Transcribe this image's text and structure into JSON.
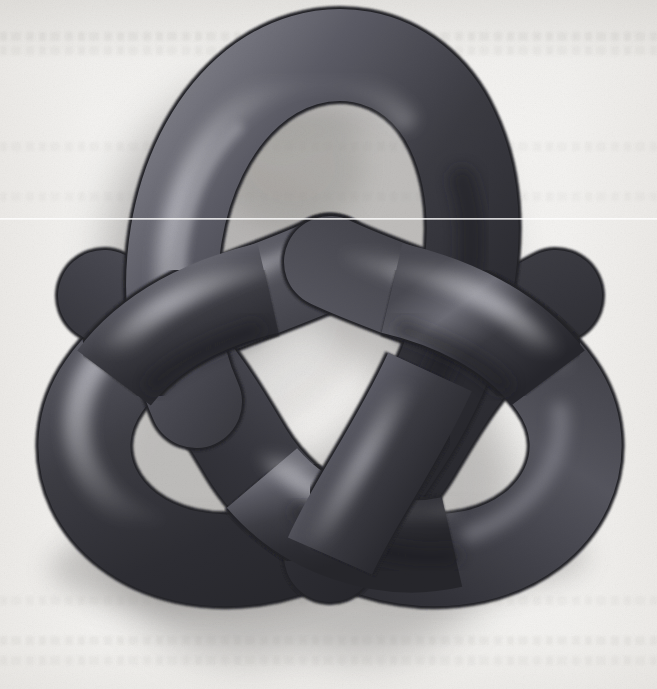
{
  "figure": {
    "kind": "3d-rendered-mathematical-object",
    "subject_name": "trefoil-knot",
    "title_text": "",
    "caption_text": "",
    "medium": "scanned book page illustration",
    "visible_text": "",
    "crossing_count": 3,
    "strand_count": 1
  },
  "canvas": {
    "width": 657,
    "height": 689
  },
  "colors": {
    "paper": "#f3f2f0",
    "paper_edge": "#eceae7",
    "tube_dark": "#34343a",
    "tube_mid": "#4a4a52",
    "tube_highlight": "#7e7e86",
    "tube_shade": "#26262b",
    "tube_outline": "#2a2a30",
    "cast_shadow": "#9c9a98",
    "scanline": "#ffffff",
    "ghost_text": "#969490"
  },
  "lighting": {
    "highlight_direction": "upper-left",
    "cast_shadow_direction": "lower-left",
    "shadow_blur_px": 26,
    "shadow_opacity": 0.45
  },
  "geometry": {
    "knot_bounds": {
      "left": 40,
      "top": 25,
      "right": 616,
      "bottom": 578
    },
    "center": {
      "x": 330,
      "y": 300
    },
    "tube_radius_px": 47,
    "lobes": [
      {
        "name": "top-lobe",
        "cx": 330,
        "cy": 160
      },
      {
        "name": "left-lobe",
        "cx": 185,
        "cy": 415
      },
      {
        "name": "right-lobe",
        "cx": 475,
        "cy": 415
      }
    ],
    "crossings": [
      {
        "name": "left-crossing",
        "x": 212,
        "y": 268,
        "over": "lower-left-strand"
      },
      {
        "name": "right-crossing",
        "x": 455,
        "y": 262,
        "over": "lower-right-strand"
      },
      {
        "name": "bottom-crossing",
        "x": 332,
        "y": 452,
        "over": "upper-left-strand"
      }
    ],
    "inner_holes": [
      {
        "name": "top-hole",
        "cx": 332,
        "cy": 175
      },
      {
        "name": "left-hole",
        "cx": 195,
        "cy": 425
      },
      {
        "name": "right-hole",
        "cx": 470,
        "cy": 425
      },
      {
        "name": "center-hole",
        "cx": 332,
        "cy": 310
      }
    ]
  },
  "artifacts": {
    "scanline": {
      "y": 218,
      "height": 2,
      "label": "scanner-line-artifact"
    },
    "ghost_text_rows": [
      {
        "y": 36,
        "label": "ghost-text-row-top-1"
      },
      {
        "y": 50,
        "label": "ghost-text-row-top-2"
      },
      {
        "y": 146,
        "label": "ghost-text-row-upper"
      },
      {
        "y": 196,
        "label": "ghost-text-row-mid-upper"
      },
      {
        "y": 600,
        "label": "ghost-text-row-lower"
      },
      {
        "y": 640,
        "label": "ghost-text-row-bottom-1"
      },
      {
        "y": 660,
        "label": "ghost-text-row-bottom-2"
      }
    ]
  }
}
